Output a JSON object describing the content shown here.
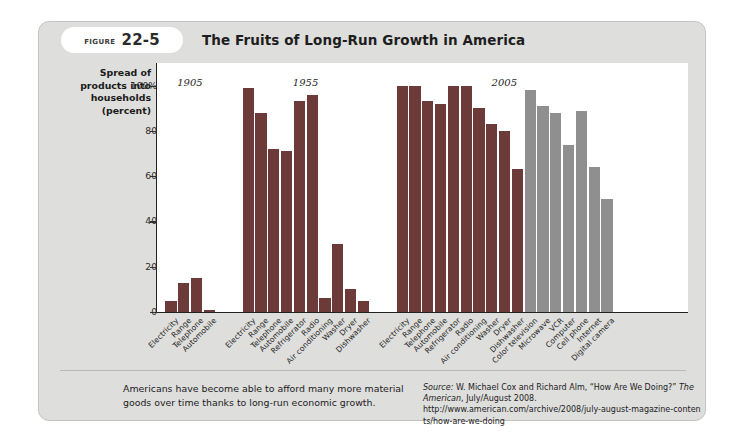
{
  "figure": {
    "badge_word": "FIGURE",
    "badge_number": "22-5",
    "title": "The Fruits of Long-Run Growth in America"
  },
  "caption": "Americans have become able to afford many more material goods over time thanks to long-run economic growth.",
  "source": {
    "label": "Source:",
    "authors": " W. Michael Cox and Richard Alm, “How Are We Doing?” ",
    "publication": "The American",
    "date": ", July/August 2008.",
    "url": "http://www.american.com/archive/2008/july-august-magazine-contents/how-are-we-doing"
  },
  "chart_data": {
    "type": "bar",
    "title": "The Fruits of Long-Run Growth in America",
    "xlabel": "",
    "ylabel": "Spread of products into households (percent)",
    "ylim": [
      0,
      110
    ],
    "yticks": [
      0,
      20,
      40,
      60,
      80,
      100
    ],
    "ytick_labels": [
      "0",
      "20",
      "40",
      "60",
      "80",
      "100%"
    ],
    "grid": false,
    "legend": "none",
    "colors": {
      "bar_primary": "#6d3a3a",
      "bar_secondary": "#8f8f8f",
      "plot_background": "#ffffff",
      "card_background": "#dededc"
    },
    "groups": [
      {
        "year": "1905",
        "categories": [
          "Electricity",
          "Range",
          "Telephone",
          "Automobile"
        ],
        "values": [
          5,
          13,
          15,
          1
        ]
      },
      {
        "year": "1955",
        "categories": [
          "Electricity",
          "Range",
          "Telephone",
          "Automobile",
          "Refrigerator",
          "Radio",
          "Air conditioning",
          "Washer",
          "Dryer",
          "Dishwasher"
        ],
        "values": [
          99,
          88,
          72,
          71,
          93,
          96,
          6,
          30,
          10,
          5
        ]
      },
      {
        "year": "2005",
        "categories": [
          "Electricity",
          "Range",
          "Telephone",
          "Automobile",
          "Refrigerator",
          "Radio",
          "Air conditioning",
          "Washer",
          "Dryer",
          "Dishwasher",
          "Color television",
          "Microwave",
          "VCR",
          "Computer",
          "Cell phone",
          "Internet",
          "Digital camera"
        ],
        "values": [
          100,
          100,
          93,
          92,
          100,
          100,
          90,
          83,
          80,
          63,
          98,
          91,
          88,
          74,
          89,
          64,
          50
        ],
        "secondary_from_index": 10
      }
    ]
  }
}
